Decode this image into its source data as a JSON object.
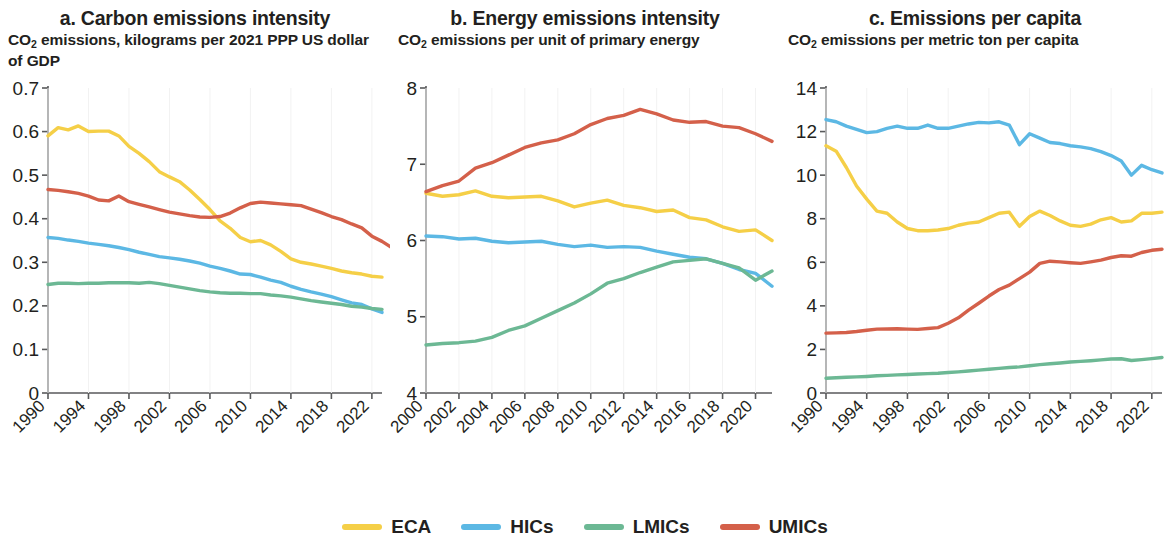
{
  "legend": {
    "items": [
      {
        "label": "ECA",
        "color": "#F5CF47"
      },
      {
        "label": "HICs",
        "color": "#5CB8E4"
      },
      {
        "label": "LMICs",
        "color": "#6CB894"
      },
      {
        "label": "UMICs",
        "color": "#D4604A"
      }
    ]
  },
  "panels": [
    {
      "id": "panel-a",
      "title": "a. Carbon emissions intensity",
      "subtitle_pre": "CO",
      "subtitle_sub": "2",
      "subtitle_post": " emissions, kilograms per 2021 PPP US dollar of GDP"
    },
    {
      "id": "panel-b",
      "title": "b. Energy emissions intensity",
      "subtitle_pre": "CO",
      "subtitle_sub": "2",
      "subtitle_post": " emissions per unit of primary energy"
    },
    {
      "id": "panel-c",
      "title": "c. Emissions per capita",
      "subtitle_pre": "CO",
      "subtitle_sub": "2",
      "subtitle_post": " emissions per metric ton per capita"
    }
  ],
  "chart_data": [
    {
      "type": "line",
      "panel": "a",
      "title": "a. Carbon emissions intensity",
      "subtitle": "CO2 emissions, kilograms per 2021 PPP US dollar of GDP",
      "xlabel": "",
      "ylabel": "",
      "grid": false,
      "legend_position": "bottom",
      "xlim": [
        1990,
        2023
      ],
      "ylim": [
        0,
        0.7
      ],
      "yticks": [
        0,
        0.1,
        0.2,
        0.3,
        0.4,
        0.5,
        0.6,
        0.7
      ],
      "ytick_labels": [
        "0",
        "0.1",
        "0.2",
        "0.3",
        "0.4",
        "0.5",
        "0.6",
        "0.7"
      ],
      "xticks": [
        1990,
        1994,
        1998,
        2002,
        2006,
        2010,
        2014,
        2018,
        2022
      ],
      "xtick_labels": [
        "1990",
        "1994",
        "1998",
        "2002",
        "2006",
        "2010",
        "2014",
        "2018",
        "2022"
      ],
      "x": [
        1990,
        1991,
        1992,
        1993,
        1994,
        1995,
        1996,
        1997,
        1998,
        1999,
        2000,
        2001,
        2002,
        2003,
        2004,
        2005,
        2006,
        2007,
        2008,
        2009,
        2010,
        2011,
        2012,
        2013,
        2014,
        2015,
        2016,
        2017,
        2018,
        2019,
        2020,
        2021,
        2022,
        2023
      ],
      "series": [
        {
          "name": "ECA",
          "color": "#F5CF47",
          "values": [
            0.59,
            0.609,
            0.604,
            0.613,
            0.6,
            0.601,
            0.601,
            0.59,
            0.566,
            0.55,
            0.531,
            0.508,
            0.496,
            0.485,
            0.466,
            0.444,
            0.421,
            0.395,
            0.378,
            0.357,
            0.347,
            0.35,
            0.34,
            0.325,
            0.308,
            0.3,
            0.296,
            0.291,
            0.286,
            0.28,
            0.276,
            0.273,
            0.268,
            0.266
          ]
        },
        {
          "name": "HICs",
          "color": "#5CB8E4",
          "values": [
            0.357,
            0.355,
            0.351,
            0.348,
            0.344,
            0.341,
            0.338,
            0.334,
            0.329,
            0.323,
            0.318,
            0.313,
            0.31,
            0.307,
            0.303,
            0.298,
            0.291,
            0.286,
            0.28,
            0.273,
            0.272,
            0.266,
            0.259,
            0.254,
            0.245,
            0.238,
            0.232,
            0.227,
            0.221,
            0.214,
            0.207,
            0.203,
            0.193,
            0.185
          ]
        },
        {
          "name": "LMICs",
          "color": "#6CB894",
          "values": [
            0.249,
            0.252,
            0.252,
            0.251,
            0.252,
            0.252,
            0.253,
            0.253,
            0.253,
            0.252,
            0.254,
            0.251,
            0.247,
            0.243,
            0.239,
            0.235,
            0.232,
            0.23,
            0.229,
            0.229,
            0.228,
            0.228,
            0.225,
            0.223,
            0.22,
            0.216,
            0.212,
            0.209,
            0.206,
            0.203,
            0.199,
            0.197,
            0.194,
            0.192
          ]
        },
        {
          "name": "UMICs",
          "color": "#D4604A",
          "values": [
            0.467,
            0.465,
            0.462,
            0.458,
            0.452,
            0.443,
            0.441,
            0.452,
            0.439,
            0.433,
            0.427,
            0.421,
            0.415,
            0.411,
            0.407,
            0.404,
            0.403,
            0.405,
            0.413,
            0.425,
            0.435,
            0.438,
            0.436,
            0.434,
            0.432,
            0.43,
            0.422,
            0.414,
            0.405,
            0.398,
            0.388,
            0.379,
            0.36,
            0.348,
            0.333
          ]
        }
      ]
    },
    {
      "type": "line",
      "panel": "b",
      "title": "b. Energy emissions intensity",
      "subtitle": "CO2 emissions per unit of primary energy",
      "xlabel": "",
      "ylabel": "",
      "grid": false,
      "legend_position": "bottom",
      "xlim": [
        2000,
        2021
      ],
      "ylim": [
        4,
        8
      ],
      "yticks": [
        4,
        5,
        6,
        7,
        8
      ],
      "ytick_labels": [
        "4",
        "5",
        "6",
        "7",
        "8"
      ],
      "xticks": [
        2000,
        2002,
        2004,
        2006,
        2008,
        2010,
        2012,
        2014,
        2016,
        2018,
        2020
      ],
      "xtick_labels": [
        "2000",
        "2002",
        "2004",
        "2006",
        "2008",
        "2010",
        "2012",
        "2014",
        "2016",
        "2018",
        "2020"
      ],
      "x": [
        2000,
        2001,
        2002,
        2003,
        2004,
        2005,
        2006,
        2007,
        2008,
        2009,
        2010,
        2011,
        2012,
        2013,
        2014,
        2015,
        2016,
        2017,
        2018,
        2019,
        2020,
        2021
      ],
      "series": [
        {
          "name": "ECA",
          "color": "#F5CF47",
          "values": [
            6.62,
            6.58,
            6.6,
            6.65,
            6.58,
            6.56,
            6.57,
            6.58,
            6.52,
            6.44,
            6.49,
            6.53,
            6.46,
            6.43,
            6.38,
            6.4,
            6.3,
            6.27,
            6.18,
            6.12,
            6.14,
            6.0
          ]
        },
        {
          "name": "HICs",
          "color": "#5CB8E4",
          "values": [
            6.06,
            6.05,
            6.02,
            6.03,
            5.99,
            5.97,
            5.98,
            5.99,
            5.95,
            5.92,
            5.94,
            5.91,
            5.92,
            5.91,
            5.86,
            5.82,
            5.78,
            5.76,
            5.7,
            5.62,
            5.57,
            5.4
          ]
        },
        {
          "name": "LMICs",
          "color": "#6CB894",
          "values": [
            4.63,
            4.65,
            4.66,
            4.68,
            4.73,
            4.82,
            4.88,
            4.98,
            5.08,
            5.18,
            5.3,
            5.44,
            5.5,
            5.58,
            5.65,
            5.72,
            5.74,
            5.76,
            5.7,
            5.64,
            5.48,
            5.6
          ]
        },
        {
          "name": "UMICs",
          "color": "#D4604A",
          "values": [
            6.64,
            6.72,
            6.78,
            6.95,
            7.02,
            7.12,
            7.22,
            7.28,
            7.32,
            7.4,
            7.52,
            7.6,
            7.64,
            7.72,
            7.66,
            7.58,
            7.55,
            7.56,
            7.5,
            7.48,
            7.4,
            7.3
          ]
        }
      ]
    },
    {
      "type": "line",
      "panel": "c",
      "title": "c. Emissions per capita",
      "subtitle": "CO2 emissions per metric ton per capita",
      "xlabel": "",
      "ylabel": "",
      "grid": false,
      "legend_position": "bottom",
      "xlim": [
        1990,
        2023
      ],
      "ylim": [
        0,
        14
      ],
      "yticks": [
        0,
        2,
        4,
        6,
        8,
        10,
        12,
        14
      ],
      "ytick_labels": [
        "0",
        "2",
        "4",
        "6",
        "8",
        "10",
        "12",
        "14"
      ],
      "xticks": [
        1990,
        1994,
        1998,
        2002,
        2006,
        2010,
        2014,
        2018,
        2022
      ],
      "xtick_labels": [
        "1990",
        "1994",
        "1998",
        "2002",
        "2006",
        "2010",
        "2014",
        "2018",
        "2022"
      ],
      "x": [
        1990,
        1991,
        1992,
        1993,
        1994,
        1995,
        1996,
        1997,
        1998,
        1999,
        2000,
        2001,
        2002,
        2003,
        2004,
        2005,
        2006,
        2007,
        2008,
        2009,
        2010,
        2011,
        2012,
        2013,
        2014,
        2015,
        2016,
        2017,
        2018,
        2019,
        2020,
        2021,
        2022,
        2023
      ],
      "series": [
        {
          "name": "ECA",
          "color": "#F5CF47",
          "values": [
            11.35,
            11.1,
            10.35,
            9.5,
            8.9,
            8.35,
            8.25,
            7.85,
            7.55,
            7.45,
            7.45,
            7.48,
            7.55,
            7.7,
            7.8,
            7.85,
            8.05,
            8.25,
            8.3,
            7.65,
            8.1,
            8.35,
            8.15,
            7.9,
            7.7,
            7.65,
            7.75,
            7.95,
            8.05,
            7.85,
            7.9,
            8.25,
            8.25,
            8.3
          ]
        },
        {
          "name": "HICs",
          "color": "#5CB8E4",
          "values": [
            12.55,
            12.45,
            12.25,
            12.1,
            11.95,
            12.0,
            12.15,
            12.25,
            12.15,
            12.15,
            12.3,
            12.15,
            12.15,
            12.25,
            12.35,
            12.42,
            12.4,
            12.45,
            12.3,
            11.4,
            11.9,
            11.7,
            11.5,
            11.45,
            11.35,
            11.3,
            11.22,
            11.08,
            10.9,
            10.65,
            10.0,
            10.45,
            10.25,
            10.1
          ]
        },
        {
          "name": "LMICs",
          "color": "#6CB894",
          "values": [
            0.68,
            0.7,
            0.72,
            0.74,
            0.76,
            0.79,
            0.81,
            0.83,
            0.85,
            0.87,
            0.89,
            0.91,
            0.94,
            0.97,
            1.01,
            1.05,
            1.09,
            1.13,
            1.17,
            1.2,
            1.25,
            1.3,
            1.34,
            1.38,
            1.42,
            1.45,
            1.48,
            1.52,
            1.56,
            1.57,
            1.49,
            1.53,
            1.58,
            1.63
          ]
        },
        {
          "name": "UMICs",
          "color": "#D4604A",
          "values": [
            2.75,
            2.76,
            2.78,
            2.82,
            2.88,
            2.93,
            2.94,
            2.95,
            2.93,
            2.92,
            2.96,
            3.0,
            3.2,
            3.45,
            3.8,
            4.12,
            4.45,
            4.75,
            4.95,
            5.25,
            5.55,
            5.95,
            6.05,
            6.02,
            5.98,
            5.95,
            6.02,
            6.1,
            6.22,
            6.3,
            6.28,
            6.45,
            6.55,
            6.6
          ]
        }
      ]
    }
  ]
}
